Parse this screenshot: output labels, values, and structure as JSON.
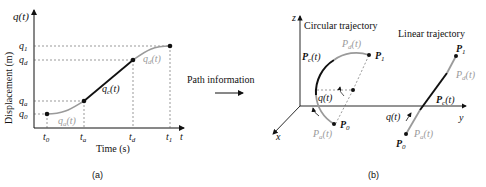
{
  "panel_a": {
    "caption": "(a)",
    "y_axis_var": "q(t)",
    "y_axis_label": "Displacement (m)",
    "x_axis_var": "t",
    "x_axis_label": "Time (s)",
    "y_ticks": [
      "q0",
      "qa",
      "qd",
      "q1"
    ],
    "x_ticks": [
      "t0",
      "ta",
      "td",
      "t1"
    ],
    "segments": {
      "accel": "qa(t)",
      "const": "qc(t)",
      "decel": "qd(t)"
    }
  },
  "arrow_label": "Path information",
  "panel_b": {
    "caption": "(b)",
    "axes": {
      "x": "x",
      "y": "y",
      "z": "z"
    },
    "circular": {
      "title": "Circular trajectory",
      "start": "P0",
      "end": "P1",
      "accel": "Pa(t)",
      "const": "Pc(t)",
      "decel": "Pd(t)",
      "param": "q(t)"
    },
    "linear": {
      "title": "Linear trajectory",
      "start": "P0",
      "end": "P1",
      "accel": "Pa(t)",
      "const": "Pc(t)",
      "decel": "Pd(t)",
      "param": "q(t)"
    }
  },
  "colors": {
    "black": "#111111",
    "gray": "#9a9a9a",
    "dashed": "#555555"
  }
}
